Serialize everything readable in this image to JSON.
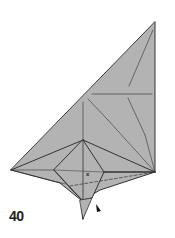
{
  "diagram": {
    "type": "origami-step",
    "step_number": "40",
    "marker_label": "x",
    "colors": {
      "paper": "#b3b3b3",
      "line": "#333333",
      "background": "#ffffff"
    },
    "elements": [
      "folded-paper-model",
      "valley-fold-dashed-line",
      "push-arrow",
      "x-reference-mark"
    ]
  }
}
